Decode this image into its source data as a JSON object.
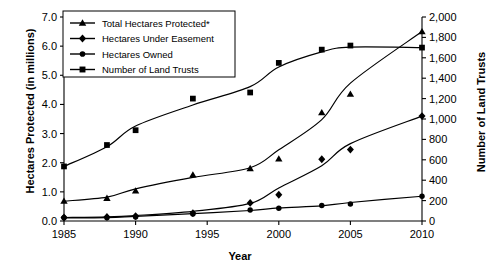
{
  "chart_data": {
    "type": "line",
    "title": "",
    "xlabel": "Year",
    "ylabel": "Hectares Protected (in millions)",
    "ylabel_right": "Number of Land Trusts",
    "x": [
      1985,
      1988,
      1990,
      1994,
      1998,
      2000,
      2003,
      2005,
      2010
    ],
    "xlim": [
      1985,
      2010
    ],
    "ylim": [
      0.0,
      7.0
    ],
    "ylim_right": [
      0,
      2000
    ],
    "xticks": [
      "1985",
      "1990",
      "1995",
      "2000",
      "2005",
      "2010"
    ],
    "xtick_values": [
      1985,
      1990,
      1995,
      2000,
      2005,
      2010
    ],
    "yticks": [
      "0.0",
      "1.0",
      "2.0",
      "3.0",
      "4.0",
      "5.0",
      "6.0",
      "7.0"
    ],
    "ytick_values": [
      0.0,
      1.0,
      2.0,
      3.0,
      4.0,
      5.0,
      6.0,
      7.0
    ],
    "yticks_right": [
      "0",
      "200",
      "400",
      "600",
      "800",
      "1,000",
      "1,200",
      "1,400",
      "1,600",
      "1,800",
      "2,000"
    ],
    "ytick_values_right": [
      0,
      200,
      400,
      600,
      800,
      1000,
      1200,
      1400,
      1600,
      1800,
      2000
    ],
    "grid": false,
    "legend_position": "top-left",
    "series": [
      {
        "name": "Total Hectares Protected*",
        "marker": "triangle",
        "axis": "left",
        "units": "millions of hectares",
        "values": [
          0.68,
          0.78,
          1.03,
          1.58,
          1.8,
          2.13,
          3.72,
          4.35,
          6.5
        ]
      },
      {
        "name": "Hectares Under Easement",
        "marker": "diamond",
        "axis": "left",
        "units": "millions of hectares",
        "values": [
          0.12,
          0.14,
          0.17,
          0.27,
          0.62,
          0.9,
          2.12,
          2.45,
          3.6
        ]
      },
      {
        "name": "Hectares Owned",
        "marker": "circle",
        "axis": "left",
        "units": "millions of hectares",
        "values": [
          0.11,
          0.11,
          0.14,
          0.24,
          0.38,
          0.44,
          0.53,
          0.58,
          0.85
        ]
      },
      {
        "name": "Number of Land Trusts",
        "marker": "square",
        "axis": "right",
        "units": "count",
        "values": [
          535,
          745,
          890,
          1200,
          1260,
          1550,
          1680,
          1720,
          1700
        ]
      }
    ],
    "annotations": [
      "*"
    ]
  },
  "legend": {
    "items": [
      {
        "label": "Total Hectares Protected*",
        "marker": "triangle"
      },
      {
        "label": "Hectares Under Easement",
        "marker": "diamond"
      },
      {
        "label": "Hectares Owned",
        "marker": "circle"
      },
      {
        "label": "Number of Land Trusts",
        "marker": "square"
      }
    ]
  },
  "axes": {
    "left_title": "Hectares Protected (in millions)",
    "right_title": "Number of Land Trusts",
    "bottom_title": "Year"
  }
}
